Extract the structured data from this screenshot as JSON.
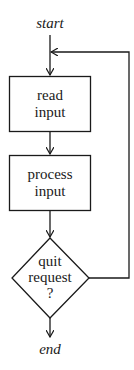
{
  "diagram": {
    "type": "flowchart",
    "terminals": {
      "start": "start",
      "end": "end"
    },
    "nodes": [
      {
        "id": "read",
        "shape": "rectangle",
        "lines": [
          "read",
          "input"
        ]
      },
      {
        "id": "process",
        "shape": "rectangle",
        "lines": [
          "process",
          "input"
        ]
      },
      {
        "id": "quit",
        "shape": "diamond",
        "lines": [
          "quit",
          "request",
          "?"
        ]
      }
    ],
    "edges": [
      {
        "from": "start",
        "to": "read"
      },
      {
        "from": "read",
        "to": "process"
      },
      {
        "from": "process",
        "to": "quit"
      },
      {
        "from": "quit",
        "to": "end"
      },
      {
        "from": "quit",
        "to": "read",
        "route": "loop-back-right"
      }
    ],
    "colors": {
      "stroke": "#1a1a1a",
      "background": "#ffffff"
    }
  }
}
